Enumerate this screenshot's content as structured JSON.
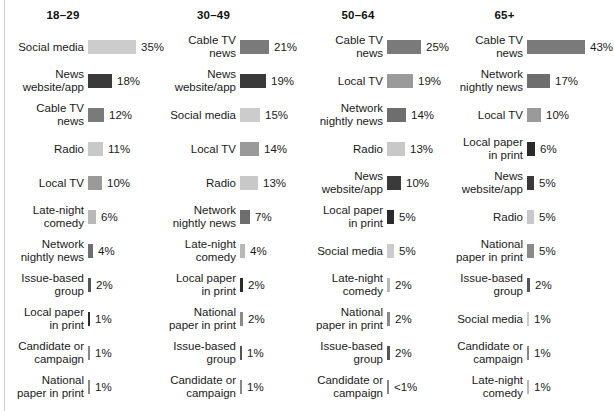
{
  "chart_data": {
    "type": "bar",
    "title": "",
    "subtitle": "",
    "xlabel": "",
    "ylabel": "",
    "grid": false,
    "legend": "none",
    "value_suffix": "%",
    "px_per_percent": 1.36,
    "category_colors": {
      "Social media": "#cccccc",
      "News website/app": "#3a3a3a",
      "Cable TV news": "#7a7a7a",
      "Radio": "#c8c8c8",
      "Local TV": "#9a9a9a",
      "Late-night comedy": "#b8b8b8",
      "Network nightly news": "#6e6e6e",
      "Issue-based group": "#555555",
      "Local paper in print": "#2a2a2a",
      "Candidate or campaign": "#888888",
      "National paper in print": "#8a8a8a"
    },
    "panels": [
      {
        "header": "18–29",
        "categories": [
          "Social media",
          "News website/app",
          "Cable TV news",
          "Radio",
          "Local TV",
          "Late-night comedy",
          "Network nightly news",
          "Issue-based group",
          "Local paper in print",
          "Candidate or campaign",
          "National paper in print"
        ],
        "values": [
          35,
          18,
          12,
          11,
          10,
          6,
          4,
          2,
          1,
          1,
          1
        ],
        "value_labels": [
          "35%",
          "18%",
          "12%",
          "11%",
          "10%",
          "6%",
          "4%",
          "2%",
          "1%",
          "1%",
          "1%"
        ],
        "label_lines": [
          "Social media",
          "News\nwebsite/app",
          "Cable TV\nnews",
          "Radio",
          "Local TV",
          "Late-night\ncomedy",
          "Network\nnightly news",
          "Issue-based\ngroup",
          "Local paper\nin print",
          "Candidate or\ncampaign",
          "National\npaper in print"
        ],
        "colors": [
          "#cccccc",
          "#3a3a3a",
          "#7a7a7a",
          "#c8c8c8",
          "#9a9a9a",
          "#b8b8b8",
          "#6e6e6e",
          "#555555",
          "#2a2a2a",
          "#888888",
          "#8a8a8a"
        ]
      },
      {
        "header": "30–49",
        "categories": [
          "Cable TV news",
          "News website/app",
          "Social media",
          "Local TV",
          "Radio",
          "Network nightly news",
          "Late-night comedy",
          "Local paper in print",
          "National paper in print",
          "Issue-based group",
          "Candidate or campaign"
        ],
        "values": [
          21,
          19,
          15,
          14,
          13,
          7,
          4,
          2,
          2,
          1,
          1
        ],
        "value_labels": [
          "21%",
          "19%",
          "15%",
          "14%",
          "13%",
          "7%",
          "4%",
          "2%",
          "2%",
          "1%",
          "1%"
        ],
        "label_lines": [
          "Cable TV\nnews",
          "News\nwebsite/app",
          "Social media",
          "Local TV",
          "Radio",
          "Network\nnightly news",
          "Late-night\ncomedy",
          "Local paper\nin print",
          "National\npaper in print",
          "Issue-based\ngroup",
          "Candidate or\ncampaign"
        ],
        "colors": [
          "#7a7a7a",
          "#3a3a3a",
          "#cccccc",
          "#9a9a9a",
          "#c8c8c8",
          "#6e6e6e",
          "#b8b8b8",
          "#2a2a2a",
          "#8a8a8a",
          "#555555",
          "#888888"
        ]
      },
      {
        "header": "50–64",
        "categories": [
          "Cable TV news",
          "Local TV",
          "Network nightly news",
          "Radio",
          "News website/app",
          "Local paper in print",
          "Social media",
          "Late-night comedy",
          "National paper in print",
          "Issue-based group",
          "Candidate or campaign"
        ],
        "values": [
          25,
          19,
          14,
          13,
          10,
          5,
          5,
          2,
          2,
          2,
          0.5
        ],
        "value_labels": [
          "25%",
          "19%",
          "14%",
          "13%",
          "10%",
          "5%",
          "5%",
          "2%",
          "2%",
          "2%",
          "<1%"
        ],
        "label_lines": [
          "Cable TV\nnews",
          "Local TV",
          "Network\nnightly news",
          "Radio",
          "News\nwebsite/app",
          "Local paper\nin print",
          "Social media",
          "Late-night\ncomedy",
          "National\npaper in print",
          "Issue-based\ngroup",
          "Candidate or\ncampaign"
        ],
        "colors": [
          "#7a7a7a",
          "#9a9a9a",
          "#6e6e6e",
          "#c8c8c8",
          "#3a3a3a",
          "#2a2a2a",
          "#cccccc",
          "#b8b8b8",
          "#8a8a8a",
          "#555555",
          "#888888"
        ]
      },
      {
        "header": "65+",
        "categories": [
          "Cable TV news",
          "Network nightly news",
          "Local TV",
          "Local paper in print",
          "News website/app",
          "Radio",
          "National paper in print",
          "Issue-based group",
          "Social media",
          "Candidate or campaign",
          "Late-night comedy"
        ],
        "values": [
          43,
          17,
          10,
          6,
          5,
          5,
          5,
          2,
          1,
          1,
          1
        ],
        "value_labels": [
          "43%",
          "17%",
          "10%",
          "6%",
          "5%",
          "5%",
          "5%",
          "2%",
          "1%",
          "1%",
          "1%"
        ],
        "label_lines": [
          "Cable TV\nnews",
          "Network\nnightly news",
          "Local TV",
          "Local paper\nin print",
          "News\nwebsite/app",
          "Radio",
          "National\npaper in print",
          "Issue-based\ngroup",
          "Social media",
          "Candidate or\ncampaign",
          "Late-night\ncomedy"
        ],
        "colors": [
          "#7a7a7a",
          "#6e6e6e",
          "#9a9a9a",
          "#2a2a2a",
          "#3a3a3a",
          "#c8c8c8",
          "#8a8a8a",
          "#555555",
          "#cccccc",
          "#888888",
          "#b8b8b8"
        ]
      }
    ]
  }
}
